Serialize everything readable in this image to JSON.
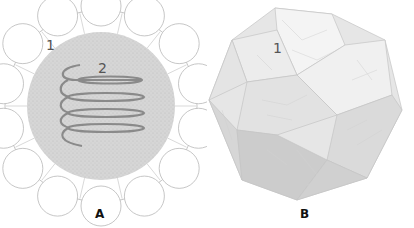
{
  "figure": {
    "panels": [
      {
        "id": "A",
        "label": "A",
        "description": "Cross-section: central stippled gray core with helical coil, surrounded by ring of scalloped white segments",
        "annotations": [
          {
            "text": "1",
            "target": "outer scalloped segment"
          },
          {
            "text": "2",
            "target": "helical coil in core"
          }
        ]
      },
      {
        "id": "B",
        "label": "B",
        "description": "3D polyhedral shell composed of tiled pentagonal/rhombic facets",
        "annotations": [
          {
            "text": "1",
            "target": "surface facet"
          }
        ]
      }
    ],
    "colors": {
      "core": "#d4d4d4",
      "segment": "#ffffff",
      "outline": "#b8b8b8",
      "coil": "#8a8a8a",
      "shell_light": "#ececec",
      "shell_dark": "#c8c8c8"
    }
  }
}
